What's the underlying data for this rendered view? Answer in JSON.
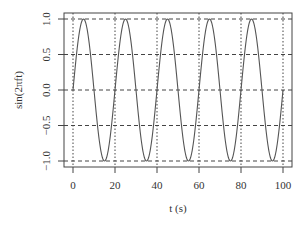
{
  "chart_data": {
    "type": "line",
    "title": "",
    "xlabel": "t (s)",
    "ylabel": "sin(2πft)",
    "xlim": [
      0,
      100
    ],
    "ylim": [
      -1,
      1
    ],
    "x_ticks": [
      0,
      20,
      40,
      60,
      80,
      100
    ],
    "x_tick_labels": [
      "0",
      "20",
      "40",
      "60",
      "80",
      "100"
    ],
    "y_ticks": [
      -1.0,
      -0.5,
      0.0,
      0.5,
      1.0
    ],
    "y_tick_labels": [
      "−1.0",
      "−0.5",
      "0.0",
      "0.5",
      "1.0"
    ],
    "grid": true,
    "series": [
      {
        "name": "sin(2πft)",
        "frequency": 0.05,
        "x": [
          0,
          5,
          10,
          15,
          20,
          25,
          30,
          35,
          40,
          45,
          50,
          55,
          60,
          65,
          70,
          75,
          80,
          85,
          90,
          95,
          100
        ],
        "values": [
          0,
          1,
          0,
          -1,
          0,
          1,
          0,
          -1,
          0,
          1,
          0,
          -1,
          0,
          1,
          0,
          -1,
          0,
          1,
          0,
          -1,
          0
        ]
      }
    ],
    "colors": {
      "line": "#555555",
      "grid": "#444444",
      "frame": "#444444"
    }
  }
}
